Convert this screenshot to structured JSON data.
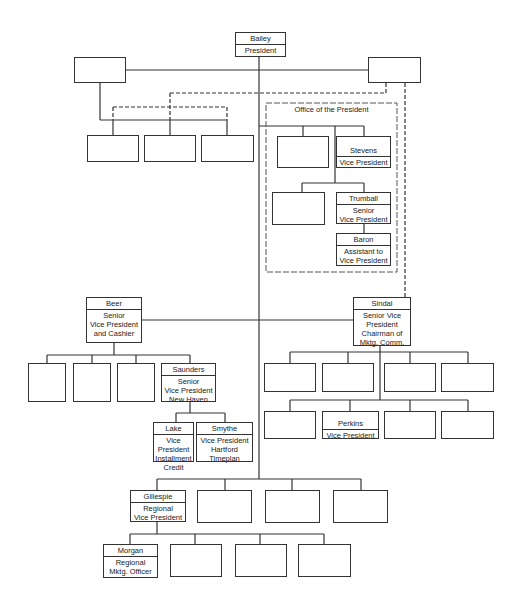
{
  "chart_title": "",
  "office_label": "Office of the President",
  "nodes": {
    "bailey": {
      "name": "Bailey",
      "title": "President"
    },
    "stevens": {
      "name": "Stevens",
      "title": "Vice President"
    },
    "trumball": {
      "name": "Trumball",
      "title": "Senior\nVice President"
    },
    "baron": {
      "name": "Baron",
      "title": "Assistant to\nVice President"
    },
    "beer": {
      "name": "Beer",
      "title": "Senior\nVice President\nand Cashier"
    },
    "saunders": {
      "name": "Saunders",
      "title": "Senior\nVice President\nNew Haven"
    },
    "lake": {
      "name": "Lake",
      "title": "Vice President\nInstallment\nCredit"
    },
    "smythe": {
      "name": "Smythe",
      "title": "Vice President\nHartford\nTimeplan"
    },
    "sindal": {
      "name": "Sindal",
      "title": "Senior Vice\nPresident\nChairman of\nMktg. Comm."
    },
    "perkins": {
      "name": "Perkins",
      "title": "Vice President"
    },
    "gillespie": {
      "name": "Gillespie",
      "title": "Regional\nVice President"
    },
    "morgan": {
      "name": "Morgan",
      "title": "Regional\nMktg. Officer"
    }
  },
  "colors": {
    "line": "#333333",
    "background": "#ffffff"
  }
}
